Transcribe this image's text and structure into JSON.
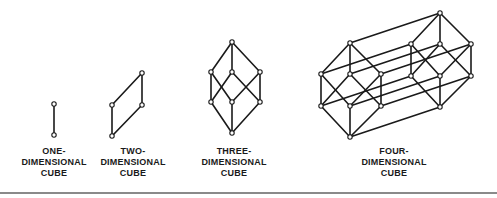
{
  "figure": {
    "panels": [
      {
        "id": "one",
        "label_lines": [
          "ONE-",
          "DIMENSIONAL",
          "CUBE"
        ],
        "vertices": 2,
        "edges": 1
      },
      {
        "id": "two",
        "label_lines": [
          "TWO-",
          "DIMENSIONAL",
          "CUBE"
        ],
        "vertices": 4,
        "edges": 4
      },
      {
        "id": "three",
        "label_lines": [
          "THREE-",
          "DIMENSIONAL",
          "CUBE"
        ],
        "vertices": 8,
        "edges": 12
      },
      {
        "id": "four",
        "label_lines": [
          "FOUR-",
          "DIMENSIONAL",
          "CUBE"
        ],
        "vertices": 16,
        "edges": 32
      }
    ],
    "colors": {
      "line": "#1a1a1a",
      "background": "#ffffff",
      "separator": "#8a8a8a"
    }
  }
}
